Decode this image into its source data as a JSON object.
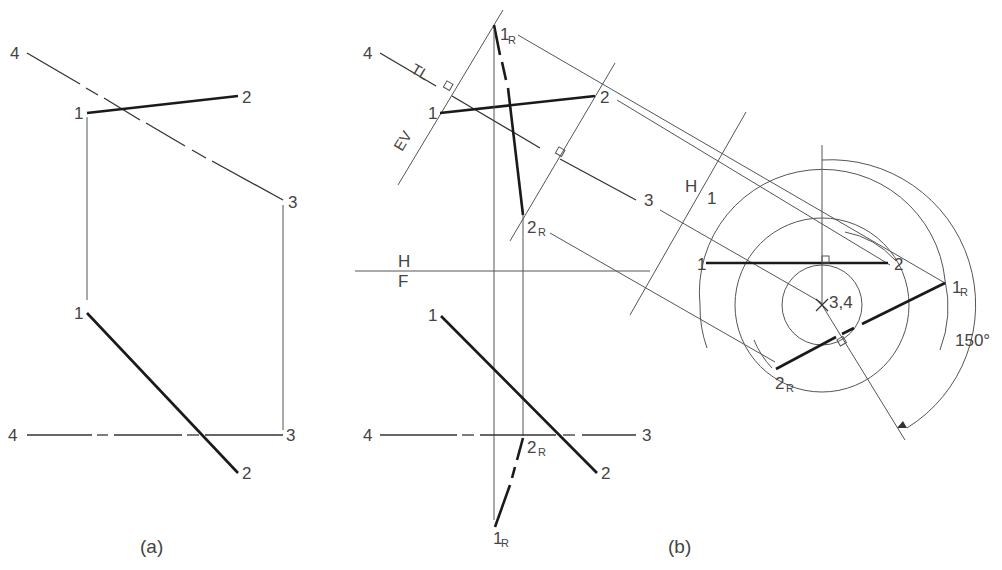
{
  "figure": {
    "captions": {
      "a": "(a)",
      "b": "(b)"
    },
    "view_a": {
      "top": {
        "labels": {
          "p1": "1",
          "p2": "2",
          "p3": "3",
          "p4": "4"
        }
      },
      "front": {
        "labels": {
          "p1": "1",
          "p2": "2",
          "p3": "3",
          "p4": "4"
        }
      }
    },
    "view_b": {
      "top": {
        "labels": {
          "p1": "1",
          "p2": "2",
          "p3": "3",
          "p4": "4",
          "r1": "1",
          "r2": "2",
          "sub_r": "R"
        },
        "annotations": {
          "tl": "TL",
          "ev": "EV"
        }
      },
      "fold_line_hf": {
        "upper": "H",
        "lower": "F"
      },
      "front": {
        "labels": {
          "p1": "1",
          "p2": "2",
          "p3": "3",
          "p4": "4",
          "r1": "1",
          "r2": "2",
          "sub_r": "R"
        }
      },
      "fold_line_h1": {
        "left": "H",
        "right": "1"
      },
      "auxiliary": {
        "labels": {
          "p1": "1",
          "p2": "2",
          "axis": "3,4",
          "r1": "1",
          "r2": "2",
          "sub_r": "R"
        },
        "rotation_angle": "150°"
      }
    }
  }
}
